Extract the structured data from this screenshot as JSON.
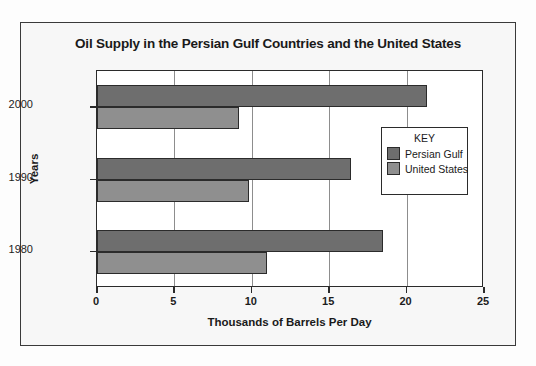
{
  "chart_data": {
    "type": "bar",
    "orientation": "horizontal",
    "title": "Oil Supply in the Persian Gulf Countries and the United States",
    "xlabel": "Thousands of Barrels Per Day",
    "ylabel": "Years",
    "categories": [
      "1980",
      "1990",
      "2000"
    ],
    "xlim": [
      0,
      25
    ],
    "xticks": [
      "0",
      "5",
      "10",
      "15",
      "20",
      "25"
    ],
    "xtick_values": [
      0,
      5,
      10,
      15,
      20,
      25
    ],
    "grid": "vertical",
    "legend_position": "inside-right",
    "legend_title": "KEY",
    "series": [
      {
        "name": "Persian Gulf",
        "color": "#6e6e6e",
        "values": [
          18.5,
          16.4,
          21.3
        ]
      },
      {
        "name": "United States",
        "color": "#8f8f8f",
        "values": [
          11.0,
          9.8,
          9.2
        ]
      }
    ]
  },
  "colors": {
    "persian_gulf": "#6e6e6e",
    "united_states": "#8f8f8f",
    "axis": "#2b2b2b",
    "grid": "#8d8d8d",
    "frame": "#3a3a3a",
    "page_background": "#f7f7f7"
  }
}
